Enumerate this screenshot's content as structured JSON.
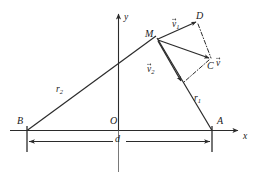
{
  "figure": {
    "kind": "vector-geometry-diagram",
    "background_color": "#ffffff",
    "line_color": "#2b2b2b",
    "axes": {
      "x_label": "x",
      "y_label": "y",
      "origin_label": "O"
    },
    "points": {
      "A": "A",
      "B": "B",
      "C": "C",
      "D": "D",
      "M": "M"
    },
    "distances": {
      "r1": "r",
      "r1_sub": "1",
      "r2": "r",
      "r2_sub": "2",
      "baseline": "d"
    },
    "vectors": {
      "v1_name": "v",
      "v1_sub": "1",
      "v2_name": "v",
      "v2_sub": "2",
      "v_name": "v"
    }
  }
}
